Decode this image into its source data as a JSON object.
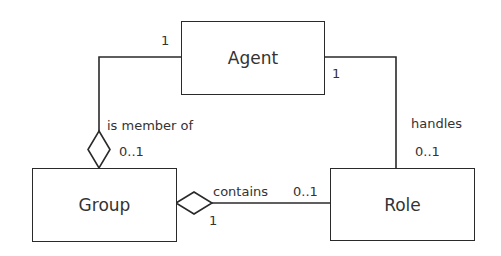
{
  "diagram": {
    "type": "UML class diagram",
    "classes": [
      {
        "id": "agent",
        "name": "Agent"
      },
      {
        "id": "group",
        "name": "Group"
      },
      {
        "id": "role",
        "name": "Role"
      }
    ],
    "associations": [
      {
        "id": "member",
        "from": "Agent",
        "to": "Group",
        "label": "is member of",
        "from_multiplicity": "1",
        "to_multiplicity": "0..1",
        "aggregation_at": "Group"
      },
      {
        "id": "handles",
        "from": "Agent",
        "to": "Role",
        "label": "handles",
        "from_multiplicity": "1",
        "to_multiplicity": "0..1"
      },
      {
        "id": "contains",
        "from": "Group",
        "to": "Role",
        "label": "contains",
        "from_multiplicity": "1",
        "to_multiplicity": "0..1",
        "aggregation_at": "Group"
      }
    ]
  },
  "labels": {
    "agent": "Agent",
    "group": "Group",
    "role": "Role",
    "is_member_of": "is member of",
    "member_agent_mult": "1",
    "member_group_mult": "0..1",
    "handles": "handles",
    "handles_agent_mult": "1",
    "handles_role_mult": "0..1",
    "contains": "contains",
    "contains_role_mult": "0..1",
    "contains_group_mult": "1"
  }
}
